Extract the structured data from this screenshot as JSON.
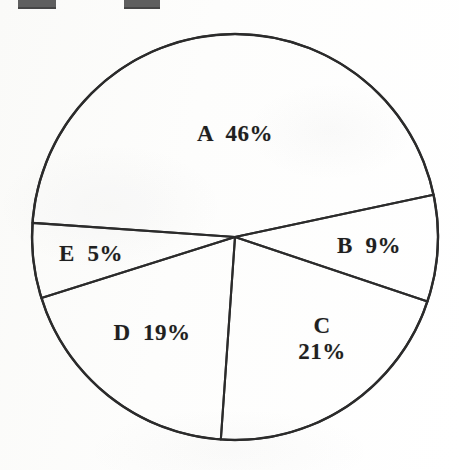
{
  "figure": {
    "background_color": "#fdfdfc",
    "ink_color": "#2b2b2b",
    "edge_marks": [
      "top-left-mark",
      "top-center-mark"
    ]
  },
  "chart_data": {
    "type": "pie",
    "title": "",
    "subtitle": "",
    "xlabel": "",
    "ylabel": "",
    "legend": "none",
    "grid": false,
    "labels_inside": true,
    "categories": [
      "A",
      "B",
      "C",
      "D",
      "E"
    ],
    "values": [
      46,
      9,
      21,
      19,
      5
    ],
    "unit": "%",
    "total": 100,
    "slices": [
      {
        "name": "A",
        "label": "A",
        "value": 46,
        "value_text": "46%",
        "label_text": "A  46%",
        "label_lines": [
          "A  46%"
        ],
        "start_angle_deg": 184,
        "end_angle_deg": 348,
        "sweep_deg": 165.6,
        "label_x": 235,
        "label_y": 134,
        "color": "#ffffff"
      },
      {
        "name": "B",
        "label": "B",
        "value": 9,
        "value_text": "9%",
        "label_text": "B  9%",
        "label_lines": [
          "B  9%"
        ],
        "start_angle_deg": 348,
        "end_angle_deg": 18.5,
        "sweep_deg": 32.4,
        "label_x": 369,
        "label_y": 246,
        "color": "#ffffff"
      },
      {
        "name": "C",
        "label": "C",
        "value": 21,
        "value_text": "21%",
        "label_text": "C 21%",
        "label_lines": [
          "C",
          "21%"
        ],
        "start_angle_deg": 18.5,
        "end_angle_deg": 94,
        "sweep_deg": 75.6,
        "label_x": 322,
        "label_y": 339,
        "color": "#ffffff"
      },
      {
        "name": "D",
        "label": "D",
        "value": 19,
        "value_text": "19%",
        "label_text": "D  19%",
        "label_lines": [
          "D  19%"
        ],
        "start_angle_deg": 94,
        "end_angle_deg": 162.5,
        "sweep_deg": 68.4,
        "label_x": 152,
        "label_y": 333,
        "color": "#ffffff"
      },
      {
        "name": "E",
        "label": "E",
        "value": 5,
        "value_text": "5%",
        "label_text": "E  5%",
        "label_lines": [
          "E  5%"
        ],
        "start_angle_deg": 162.5,
        "end_angle_deg": 184,
        "sweep_deg": 18,
        "label_x": 91,
        "label_y": 254,
        "color": "#ffffff"
      }
    ],
    "geometry": {
      "center_x": 235,
      "center_y": 237,
      "radius": 203
    }
  }
}
